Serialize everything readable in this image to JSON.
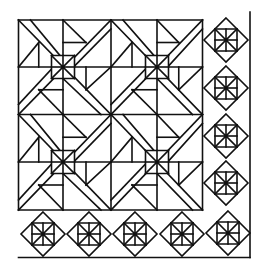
{
  "canvas": {
    "width": 265,
    "height": 273,
    "background": "#ffffff",
    "stroke": "#111111"
  },
  "main_block": {
    "x0": 18.5,
    "y0": 20,
    "x1": 111,
    "y1": 114.5,
    "x2": 202.5,
    "y2": 210,
    "tiles": [
      {
        "cx": 63,
        "cy": 67
      },
      {
        "cx": 157,
        "cy": 67
      },
      {
        "cx": 63,
        "cy": 162
      },
      {
        "cx": 157,
        "cy": 162
      }
    ],
    "small_square_half": 11.5,
    "band_offset": 12,
    "inner_step": 22.5
  },
  "border": {
    "right_line_x": 250,
    "bottom_line_y": 257.5,
    "diamond_half": 22,
    "inner_square_half": 11,
    "right_column": [
      {
        "cx": 226,
        "cy": 40
      },
      {
        "cx": 226,
        "cy": 88
      },
      {
        "cx": 226,
        "cy": 136
      },
      {
        "cx": 226,
        "cy": 183
      }
    ],
    "bottom_row": [
      {
        "cx": 43,
        "cy": 234
      },
      {
        "cx": 89,
        "cy": 234
      },
      {
        "cx": 135,
        "cy": 234
      },
      {
        "cx": 182,
        "cy": 234
      },
      {
        "cx": 228,
        "cy": 233
      }
    ]
  }
}
